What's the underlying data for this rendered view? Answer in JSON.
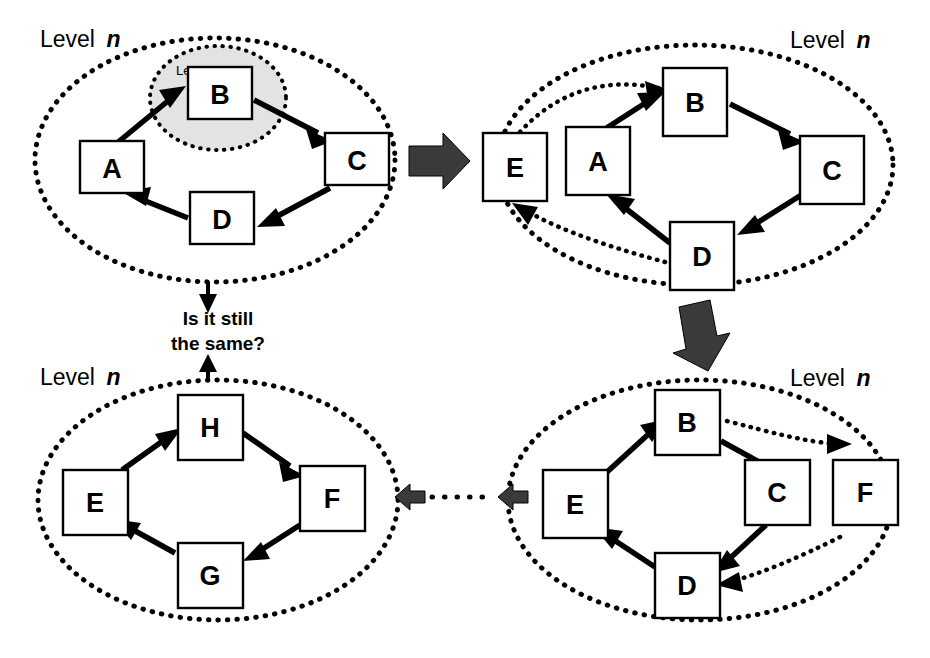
{
  "figure": {
    "background_color": "#ffffff",
    "ink_color": "#000000",
    "inner_region_fill": "#e3e3e3",
    "block_arrow_color": "#3a3a3a"
  },
  "panels": [
    {
      "id": "panel-top-left",
      "level_label_word": "Level",
      "level_label_var": "n",
      "inner_label_word": "Level",
      "inner_label_var": "n-1",
      "nodes": [
        {
          "id": "A",
          "label": "A"
        },
        {
          "id": "B",
          "label": "B"
        },
        {
          "id": "C",
          "label": "C"
        },
        {
          "id": "D",
          "label": "D"
        }
      ],
      "edges": [
        {
          "from": "A",
          "to": "B",
          "style": "solid"
        },
        {
          "from": "B",
          "to": "C",
          "style": "solid"
        },
        {
          "from": "C",
          "to": "D",
          "style": "solid"
        },
        {
          "from": "D",
          "to": "A",
          "style": "solid"
        }
      ]
    },
    {
      "id": "panel-top-right",
      "level_label_word": "Level",
      "level_label_var": "n",
      "nodes": [
        {
          "id": "E",
          "label": "E"
        },
        {
          "id": "A",
          "label": "A"
        },
        {
          "id": "B",
          "label": "B"
        },
        {
          "id": "C",
          "label": "C"
        },
        {
          "id": "D",
          "label": "D"
        }
      ],
      "edges": [
        {
          "from": "A",
          "to": "B",
          "style": "solid"
        },
        {
          "from": "B",
          "to": "C",
          "style": "solid"
        },
        {
          "from": "C",
          "to": "D",
          "style": "solid"
        },
        {
          "from": "D",
          "to": "A",
          "style": "solid"
        },
        {
          "from": "E",
          "to": "B",
          "style": "dotted"
        },
        {
          "from": "D",
          "to": "E",
          "style": "dotted"
        }
      ]
    },
    {
      "id": "panel-bottom-right",
      "level_label_word": "Level",
      "level_label_var": "n",
      "nodes": [
        {
          "id": "E",
          "label": "E"
        },
        {
          "id": "B",
          "label": "B"
        },
        {
          "id": "C",
          "label": "C"
        },
        {
          "id": "F",
          "label": "F"
        },
        {
          "id": "D",
          "label": "D"
        }
      ],
      "edges": [
        {
          "from": "E",
          "to": "B",
          "style": "solid"
        },
        {
          "from": "B",
          "to": "C",
          "style": "solid"
        },
        {
          "from": "C",
          "to": "D",
          "style": "solid"
        },
        {
          "from": "D",
          "to": "E",
          "style": "solid"
        },
        {
          "from": "B",
          "to": "F",
          "style": "dotted"
        },
        {
          "from": "F",
          "to": "D",
          "style": "dotted"
        }
      ]
    },
    {
      "id": "panel-bottom-left",
      "level_label_word": "Level",
      "level_label_var": "n",
      "nodes": [
        {
          "id": "E",
          "label": "E"
        },
        {
          "id": "H",
          "label": "H"
        },
        {
          "id": "F",
          "label": "F"
        },
        {
          "id": "G",
          "label": "G"
        }
      ],
      "edges": [
        {
          "from": "E",
          "to": "H",
          "style": "solid"
        },
        {
          "from": "H",
          "to": "F",
          "style": "solid"
        },
        {
          "from": "F",
          "to": "G",
          "style": "solid"
        },
        {
          "from": "G",
          "to": "E",
          "style": "solid"
        }
      ]
    }
  ],
  "flow": {
    "arrow_right_top": "block-arrow-right",
    "arrow_down_right": "block-arrow-down",
    "arrow_left_bottom": "block-arrow-left",
    "question_line1": "Is it still",
    "question_line2": "the same?",
    "question_arrow_in": "arrow-down-into-question",
    "question_arrow_out": "arrow-up-into-question"
  }
}
